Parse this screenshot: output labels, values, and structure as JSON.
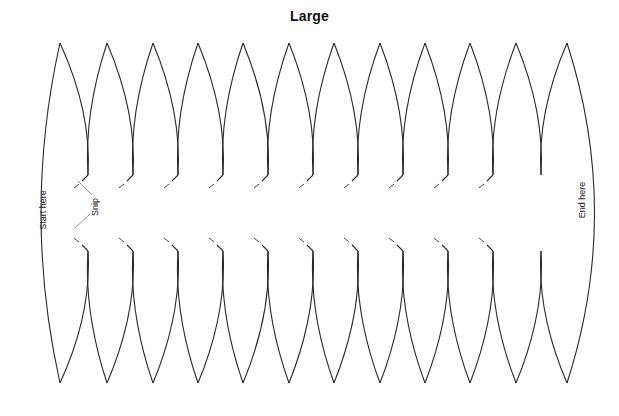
{
  "title": "Large",
  "labels": {
    "start": "Start here",
    "end": "End here",
    "snip": "Snip"
  },
  "template": {
    "gore_count": 12,
    "tabbed_joints": 10,
    "untabbed_joints": 1,
    "stroke_color": "#2a2a2a",
    "background": "#ffffff"
  }
}
